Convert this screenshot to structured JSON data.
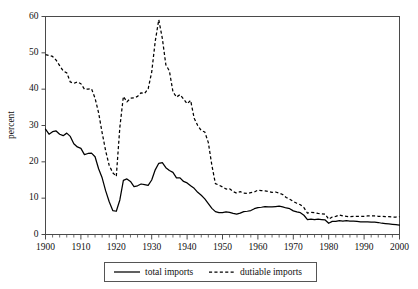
{
  "chart_data": {
    "type": "line",
    "title": "",
    "subtitle": "",
    "xlabel": "",
    "ylabel": "percent",
    "xlim": [
      1900,
      2000
    ],
    "ylim": [
      0,
      60
    ],
    "grid": false,
    "legend_position": "bottom-center",
    "y_ticks": [
      0,
      10,
      20,
      30,
      40,
      50,
      60
    ],
    "y_tick_labels": [
      "0",
      "10",
      "20",
      "30",
      "40",
      "50",
      "60"
    ],
    "x_ticks": [
      1900,
      1910,
      1920,
      1930,
      1940,
      1950,
      1960,
      1970,
      1980,
      1990,
      2000
    ],
    "x_tick_labels": [
      "1900",
      "1910",
      "1920",
      "1930",
      "1940",
      "1950",
      "1960",
      "1970",
      "1980",
      "1990",
      "2000"
    ],
    "x_minor_tick_step": 2,
    "line_color": "#000000",
    "axis_color": "#4a4a4a",
    "background_color": "#ffffff",
    "series": [
      {
        "name": "total imports",
        "style": "solid",
        "color": "#000000",
        "x": [
          1900,
          1901,
          1902,
          1903,
          1904,
          1905,
          1906,
          1907,
          1908,
          1909,
          1910,
          1911,
          1912,
          1913,
          1914,
          1915,
          1916,
          1917,
          1918,
          1919,
          1920,
          1921,
          1922,
          1923,
          1924,
          1925,
          1926,
          1927,
          1928,
          1929,
          1930,
          1931,
          1932,
          1933,
          1934,
          1935,
          1936,
          1937,
          1938,
          1939,
          1940,
          1941,
          1942,
          1943,
          1944,
          1945,
          1946,
          1947,
          1948,
          1949,
          1950,
          1951,
          1952,
          1953,
          1954,
          1955,
          1956,
          1957,
          1958,
          1959,
          1960,
          1961,
          1962,
          1963,
          1964,
          1965,
          1966,
          1967,
          1968,
          1969,
          1970,
          1971,
          1972,
          1973,
          1974,
          1975,
          1976,
          1977,
          1978,
          1979,
          1980,
          1981,
          1982,
          1983,
          1984,
          1985,
          1986,
          1987,
          1988,
          1989,
          1990,
          1991,
          1992,
          1993,
          1994,
          1995,
          1996,
          1997,
          1998,
          1999,
          2000
        ],
        "values": [
          29.0,
          27.6,
          28.3,
          28.5,
          27.6,
          27.2,
          27.9,
          27.0,
          25.0,
          24.1,
          23.7,
          22.0,
          22.3,
          22.4,
          21.4,
          18.1,
          15.6,
          12.0,
          9.0,
          6.6,
          6.4,
          9.5,
          14.9,
          15.3,
          14.6,
          13.2,
          13.4,
          13.9,
          13.7,
          13.5,
          15.0,
          17.8,
          19.6,
          19.8,
          18.4,
          17.6,
          17.1,
          15.6,
          15.6,
          14.6,
          14.2,
          13.4,
          12.7,
          11.6,
          10.8,
          9.8,
          8.5,
          7.2,
          6.3,
          6.0,
          6.0,
          6.2,
          6.1,
          5.8,
          5.6,
          5.9,
          6.3,
          6.4,
          6.6,
          7.1,
          7.4,
          7.5,
          7.7,
          7.6,
          7.6,
          7.7,
          7.8,
          7.6,
          7.3,
          7.1,
          6.5,
          6.2,
          6.0,
          5.3,
          4.1,
          4.2,
          4.1,
          4.2,
          4.1,
          4.0,
          3.1,
          3.6,
          3.6,
          3.8,
          3.7,
          3.8,
          3.7,
          3.7,
          3.6,
          3.5,
          3.5,
          3.5,
          3.4,
          3.4,
          3.3,
          3.1,
          3.0,
          2.9,
          2.8,
          2.7,
          2.6
        ]
      },
      {
        "name": "dutiable imports",
        "style": "dashed",
        "color": "#000000",
        "x": [
          1900,
          1901,
          1902,
          1903,
          1904,
          1905,
          1906,
          1907,
          1908,
          1909,
          1910,
          1911,
          1912,
          1913,
          1914,
          1915,
          1916,
          1917,
          1918,
          1919,
          1920,
          1921,
          1922,
          1923,
          1924,
          1925,
          1926,
          1927,
          1928,
          1929,
          1930,
          1931,
          1932,
          1933,
          1934,
          1935,
          1936,
          1937,
          1938,
          1939,
          1940,
          1941,
          1942,
          1943,
          1944,
          1945,
          1946,
          1947,
          1948,
          1949,
          1950,
          1951,
          1952,
          1953,
          1954,
          1955,
          1956,
          1957,
          1958,
          1959,
          1960,
          1961,
          1962,
          1963,
          1964,
          1965,
          1966,
          1967,
          1968,
          1969,
          1970,
          1971,
          1972,
          1973,
          1974,
          1975,
          1976,
          1977,
          1978,
          1979,
          1980,
          1981,
          1982,
          1983,
          1984,
          1985,
          1986,
          1987,
          1988,
          1989,
          1990,
          1991,
          1992,
          1993,
          1994,
          1995,
          1996,
          1997,
          1998,
          1999,
          2000
        ],
        "values": [
          49.5,
          49.3,
          49.0,
          48.0,
          46.5,
          45.0,
          44.5,
          42.0,
          41.6,
          42.0,
          41.5,
          40.0,
          40.0,
          40.1,
          37.5,
          33.5,
          28.0,
          23.0,
          19.0,
          17.0,
          16.0,
          29.5,
          38.0,
          36.5,
          37.5,
          37.6,
          38.0,
          39.0,
          38.8,
          40.1,
          44.7,
          53.2,
          59.1,
          54.0,
          46.7,
          45.0,
          39.3,
          37.8,
          38.5,
          37.3,
          36.0,
          36.9,
          32.0,
          30.0,
          28.6,
          28.2,
          25.3,
          19.0,
          14.0,
          13.6,
          13.1,
          12.5,
          12.6,
          11.8,
          11.4,
          11.8,
          11.4,
          11.3,
          11.5,
          11.7,
          12.2,
          12.1,
          12.0,
          11.8,
          11.6,
          11.7,
          11.4,
          11.0,
          10.2,
          9.7,
          9.1,
          8.6,
          8.2,
          7.4,
          5.9,
          6.1,
          6.0,
          5.8,
          5.7,
          5.6,
          4.2,
          4.8,
          5.0,
          5.4,
          5.1,
          5.0,
          4.9,
          5.0,
          5.0,
          5.0,
          5.0,
          5.1,
          5.1,
          5.1,
          5.0,
          5.0,
          4.9,
          4.9,
          4.8,
          4.8,
          4.9
        ]
      }
    ]
  },
  "legend": {
    "entries": [
      {
        "label": "total imports",
        "style": "solid"
      },
      {
        "label": "dutiable imports",
        "style": "dashed"
      }
    ]
  },
  "axis": {
    "y_title": "percent"
  }
}
